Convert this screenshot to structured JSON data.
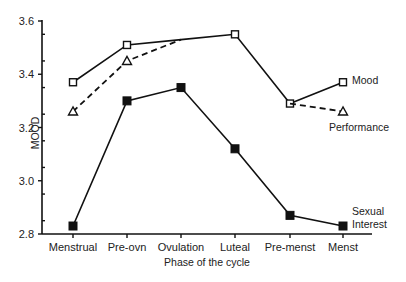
{
  "chart_data": {
    "type": "line",
    "title": "",
    "xlabel": "Phase of the cycle",
    "ylabel": "MOOD",
    "ylim": [
      2.8,
      3.6
    ],
    "yticks": [
      2.8,
      3.0,
      3.2,
      3.4,
      3.6
    ],
    "ytick_labels": [
      "2.8",
      "3.0",
      "3.2",
      "3.4",
      "3.6"
    ],
    "categories": [
      "Menstrual",
      "Pre-ovn",
      "Ovulation",
      "Luteal",
      "Pre-menst",
      "Menst"
    ],
    "grid": false,
    "legend_position": "inline-right",
    "series": [
      {
        "name": "Mood",
        "label_lines": [
          "Mood"
        ],
        "style": "solid",
        "marker": "open-square",
        "values": [
          3.37,
          3.51,
          3.53,
          3.55,
          3.29,
          3.37
        ],
        "marker_mask": [
          true,
          true,
          false,
          true,
          true,
          true
        ]
      },
      {
        "name": "Performance",
        "label_lines": [
          "Performance"
        ],
        "style": "dashed",
        "marker": "open-triangle",
        "values": [
          3.26,
          3.45,
          3.53,
          3.55,
          3.29,
          3.26
        ],
        "marker_mask": [
          true,
          true,
          false,
          false,
          false,
          true
        ],
        "dashed_segments": [
          [
            0,
            2
          ],
          [
            4,
            5
          ]
        ]
      },
      {
        "name": "Sexual Interest",
        "label_lines": [
          "Sexual",
          "Interest"
        ],
        "style": "solid",
        "marker": "filled-square",
        "values": [
          2.83,
          3.3,
          3.35,
          3.12,
          2.87,
          2.83
        ],
        "marker_mask": [
          true,
          true,
          true,
          true,
          true,
          true
        ]
      }
    ]
  },
  "layout": {
    "x_positions": [
      73,
      127,
      181,
      235,
      290,
      343
    ],
    "plot_left": 42,
    "plot_right": 372,
    "plot_top": 21,
    "plot_bottom": 234,
    "label_positions": {
      "Mood": [
        352,
        84
      ],
      "Performance": [
        329,
        131
      ],
      "Sexual Interest": [
        352,
        215
      ]
    },
    "colors": {
      "ink": "#111111",
      "background": "#ffffff"
    }
  }
}
